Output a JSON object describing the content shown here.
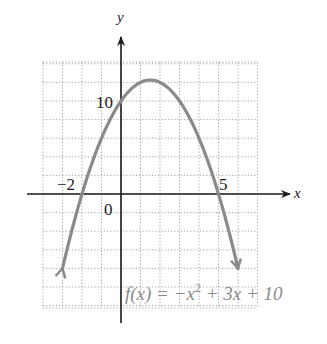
{
  "chart_data": {
    "type": "line",
    "title": "",
    "function_label": "f(x) = −x² + 3x + 10",
    "function_label_parts": {
      "lhs": "f(x) = −x",
      "exp": "2",
      "rhs": " + 3x + 10"
    },
    "xlabel": "x",
    "ylabel": "y",
    "xlim": [
      -4,
      7
    ],
    "ylim": [
      -12,
      14
    ],
    "grid": true,
    "grid_step": {
      "x": 1,
      "y": 2
    },
    "tick_labels": {
      "x_neg": "−2",
      "x_pos": "5",
      "y_pos": "10",
      "origin": "0"
    },
    "series": [
      {
        "name": "f(x) = -x^2 + 3x + 10",
        "coefficients": {
          "a": -1,
          "b": 3,
          "c": 10
        },
        "x_range": [
          -3,
          6
        ],
        "key_points": [
          {
            "x": -2,
            "y": 0,
            "label": "x-intercept"
          },
          {
            "x": 5,
            "y": 0,
            "label": "x-intercept"
          },
          {
            "x": 0,
            "y": 10,
            "label": "y-intercept"
          },
          {
            "x": 1.5,
            "y": 12.25,
            "label": "vertex"
          }
        ],
        "color": "#8a8a8a"
      }
    ],
    "colors": {
      "axis": "#1a1a1a",
      "grid": "#9a9a9a",
      "curve": "#8a8a8a",
      "label": "#1a1a1a",
      "formula": "#8a8a8a"
    }
  }
}
